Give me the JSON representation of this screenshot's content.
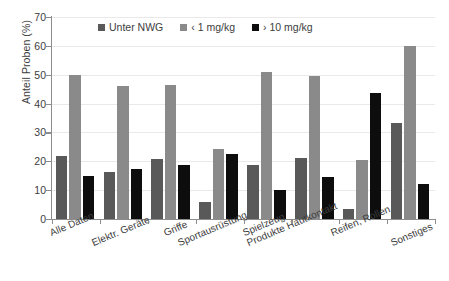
{
  "chart_data": {
    "type": "bar",
    "title": "",
    "xlabel": "",
    "ylabel": "Anteil Proben (%)",
    "ylim": [
      0,
      70
    ],
    "yticks": [
      0,
      10,
      20,
      30,
      40,
      50,
      60,
      70
    ],
    "ytick_labels": [
      "0",
      "10",
      "20",
      "30",
      "40",
      "50",
      "60",
      "70"
    ],
    "grid": true,
    "legend_position": "top-center",
    "categories": [
      "Alle Daten",
      "Elektr. Geräte",
      "Griffe",
      "Sportausrüstung",
      "Spielzeug",
      "Produkte Hautkontakt",
      "Reifen, Rollen",
      "Sonstiges"
    ],
    "series": [
      {
        "name": "Unter NWG",
        "color": "#595959",
        "values": [
          22.0,
          16.2,
          20.8,
          6.0,
          18.8,
          21.1,
          3.4,
          33.2
        ]
      },
      {
        "name": "‹ 1 mg/kg",
        "color": "#8a8a8a",
        "values": [
          50.0,
          46.0,
          46.6,
          24.2,
          51.0,
          49.5,
          20.5,
          59.9
        ]
      },
      {
        "name": "› 10 mg/kg",
        "color": "#0d0d0d",
        "values": [
          14.9,
          17.3,
          18.7,
          22.5,
          10.1,
          14.4,
          43.5,
          12.1
        ]
      }
    ]
  },
  "colors": {
    "series_1": "#595959",
    "series_2": "#8a8a8a",
    "series_3": "#0d0d0d",
    "axis": "#8d8d8d",
    "grid": "#e9e9e9",
    "text": "#3d3d3d",
    "background": "#ffffff"
  }
}
